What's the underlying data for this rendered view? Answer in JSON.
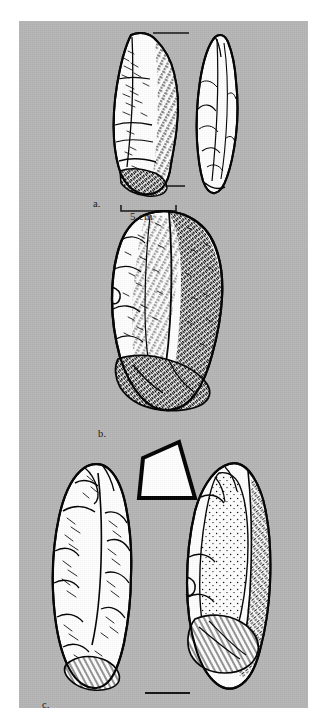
{
  "figure": {
    "background_color": "#b6b6b6",
    "page_color": "#ffffff",
    "ink_color": "#000000",
    "fill_color": "#ffffff",
    "panel": {
      "x": 19,
      "y": 21,
      "width": 289,
      "height": 687
    }
  },
  "captions": {
    "a": "a.",
    "b": "b.",
    "c": "c."
  },
  "scale": {
    "label": "5 cm",
    "bar_start_x": 102,
    "bar_end_x": 157,
    "bar_y": 190
  },
  "rules": [
    {
      "name": "rule-top-a",
      "x1": 134,
      "y": 12,
      "x2": 170
    },
    {
      "name": "rule-bottom-a",
      "x1": 131,
      "y": 165,
      "x2": 166
    },
    {
      "name": "rule-bottom-c",
      "x1": 126,
      "y": 672,
      "x2": 171
    }
  ],
  "specimens": [
    {
      "id": "a",
      "label": "a.",
      "description": "pointed biface, two views",
      "views": [
        "dorsal-stippled",
        "lateral-outline"
      ]
    },
    {
      "id": "b",
      "label": "b.",
      "description": "large heavily stippled biface, single view",
      "views": [
        "dorsal-stippled"
      ]
    },
    {
      "id": "c",
      "label": "c.",
      "description": "elongated biface with triangular cross-section inset",
      "views": [
        "dorsal",
        "ventral",
        "cross-section-triangle"
      ]
    }
  ],
  "cross_section": {
    "name": "triangular-cross-section",
    "points": "120,22 76,82 73,76 158,77"
  }
}
